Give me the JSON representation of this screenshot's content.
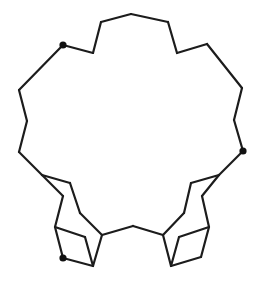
{
  "diagram": {
    "type": "line-drawing",
    "stroke_color": "#1c1c1c",
    "dot_color": "#111111",
    "dots": [
      {
        "x": 63,
        "y": 45
      },
      {
        "x": 243,
        "y": 151
      },
      {
        "x": 63,
        "y": 258
      }
    ],
    "edges": [
      [
        63,
        45,
        93,
        53
      ],
      [
        93,
        53,
        101,
        22
      ],
      [
        101,
        22,
        131,
        14
      ],
      [
        131,
        14,
        168,
        22
      ],
      [
        168,
        22,
        177,
        53
      ],
      [
        177,
        53,
        207,
        44
      ],
      [
        207,
        44,
        242,
        88
      ],
      [
        242,
        88,
        234,
        120
      ],
      [
        234,
        120,
        243,
        151
      ],
      [
        63,
        45,
        19,
        90
      ],
      [
        19,
        90,
        27,
        121
      ],
      [
        27,
        121,
        19,
        152
      ],
      [
        19,
        152,
        42,
        175
      ],
      [
        42,
        175,
        70,
        183
      ],
      [
        70,
        183,
        80,
        213
      ],
      [
        80,
        213,
        102,
        235
      ],
      [
        102,
        235,
        93,
        266
      ],
      [
        42,
        175,
        63,
        196
      ],
      [
        63,
        196,
        55,
        227
      ],
      [
        55,
        227,
        63,
        258
      ],
      [
        63,
        258,
        93,
        266
      ],
      [
        55,
        227,
        85,
        237
      ],
      [
        85,
        237,
        93,
        266
      ],
      [
        102,
        235,
        133,
        226
      ],
      [
        133,
        226,
        163,
        235
      ],
      [
        243,
        151,
        219,
        175
      ],
      [
        219,
        175,
        202,
        196
      ],
      [
        202,
        196,
        209,
        227
      ],
      [
        209,
        227,
        201,
        257
      ],
      [
        201,
        257,
        171,
        266
      ],
      [
        219,
        175,
        191,
        183
      ],
      [
        191,
        183,
        184,
        213
      ],
      [
        184,
        213,
        163,
        235
      ],
      [
        163,
        235,
        171,
        266
      ],
      [
        209,
        227,
        179,
        237
      ],
      [
        179,
        237,
        171,
        266
      ]
    ]
  }
}
